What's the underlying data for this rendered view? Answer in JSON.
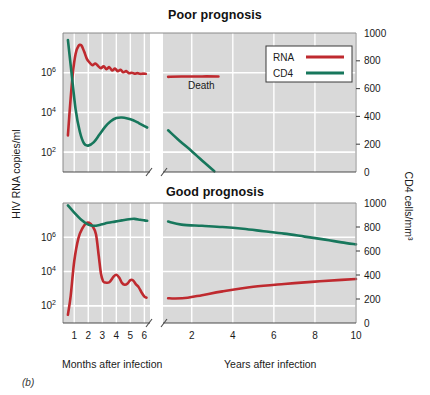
{
  "figure": {
    "panel_letter": "(b)",
    "colors": {
      "rna": "#bf2a2f",
      "cd4": "#17775c",
      "plot_background": "#d9d9d9",
      "gridline": "#ffffff",
      "axis": "#555555"
    }
  },
  "axes": {
    "y_left_title": "HIV RNA copies/ml",
    "y_right_title": "CD4 cells/mm³",
    "x_title_left": "Months after infection",
    "x_title_right": "Years after infection",
    "y_left_ticks": [
      {
        "label": "10",
        "exponent": "6",
        "value": 1000000
      },
      {
        "label": "10",
        "exponent": "4",
        "value": 10000
      },
      {
        "label": "10",
        "exponent": "2",
        "value": 100
      }
    ],
    "y_right_ticks": [
      "1000",
      "800",
      "600",
      "400",
      "200",
      "0"
    ],
    "x_ticks_months": [
      "1",
      "2",
      "3",
      "4",
      "5",
      "6"
    ],
    "x_ticks_years": [
      "2",
      "4",
      "6",
      "8",
      "10"
    ]
  },
  "legend": {
    "position": "top-right",
    "items": [
      {
        "label": "RNA",
        "color": "#bf2a2f"
      },
      {
        "label": "CD4",
        "color": "#17775c"
      }
    ]
  },
  "annotations": [
    {
      "text": "Death",
      "panel": "poor-prognosis"
    }
  ],
  "chart_data": [
    {
      "type": "line",
      "title": "Poor prognosis",
      "xlabel": "Months after infection / Years after infection",
      "ylabel": "HIV RNA copies/ml",
      "y2label": "CD4 cells/mm³",
      "ylim": [
        10,
        100000000
      ],
      "y2lim": [
        0,
        1000
      ],
      "yscale": "log",
      "grid": true,
      "legend_position": "top-right",
      "x_axis_break_after_months": 6,
      "annotation": "Death",
      "series": [
        {
          "name": "RNA",
          "color": "#bf2a2f",
          "axis": "left",
          "units": "copies/ml",
          "segment_months": {
            "x_months": [
              0.55,
              0.7,
              0.9,
              1.1,
              1.3,
              1.5,
              1.7,
              1.9,
              2.1,
              2.3,
              2.5,
              2.7,
              2.9,
              3.1,
              3.3,
              3.5,
              3.7,
              3.9,
              4.1,
              4.3,
              4.5,
              4.7,
              4.9,
              5.1,
              5.3,
              5.5,
              5.7,
              5.9,
              6.1
            ],
            "y_values": [
              700,
              20000,
              900000,
              9000000,
              22000000,
              24000000,
              12000000,
              5000000,
              3200000,
              2400000,
              2900000,
              2200000,
              1700000,
              2100000,
              1500000,
              1900000,
              1300000,
              1600000,
              1200000,
              1400000,
              1050000,
              1200000,
              950000,
              1000000,
              900000,
              950000,
              880000,
              900000,
              880000
            ]
          },
          "segment_years": {
            "x_years": [
              0.85,
              1.5,
              2.5,
              3.3
            ],
            "y_values": [
              620000,
              640000,
              650000,
              650000
            ]
          }
        },
        {
          "name": "CD4",
          "color": "#17775c",
          "axis": "right",
          "units": "cells/mm3",
          "segment_months": {
            "x_months": [
              0.55,
              0.8,
              1.1,
              1.4,
              1.7,
              2.0,
              2.4,
              2.8,
              3.2,
              3.6,
              4.0,
              4.4,
              4.8,
              5.2,
              5.6,
              6.0,
              6.2
            ],
            "y_values": [
              950,
              720,
              450,
              290,
              205,
              190,
              215,
              270,
              325,
              365,
              388,
              392,
              385,
              372,
              352,
              330,
              320
            ]
          },
          "segment_years": {
            "x_years": [
              0.85,
              1.4,
              2.0,
              2.6,
              3.1
            ],
            "y_values": [
              300,
              225,
              150,
              70,
              5
            ]
          }
        }
      ]
    },
    {
      "type": "line",
      "title": "Good prognosis",
      "xlabel": "Months after infection / Years after infection",
      "ylabel": "HIV RNA copies/ml",
      "y2label": "CD4 cells/mm³",
      "ylim": [
        10,
        100000000
      ],
      "y2lim": [
        0,
        1000
      ],
      "yscale": "log",
      "grid": true,
      "x_axis_break_after_months": 6,
      "series": [
        {
          "name": "RNA",
          "color": "#bf2a2f",
          "axis": "left",
          "units": "copies/ml",
          "segment_months": {
            "x_months": [
              0.55,
              0.75,
              1.0,
              1.3,
              1.6,
              1.85,
              2.05,
              2.3,
              2.55,
              2.75,
              2.9,
              3.05,
              3.2,
              3.5,
              3.8,
              4.0,
              4.2,
              4.4,
              4.6,
              4.8,
              5.0,
              5.2,
              5.4,
              5.6,
              5.8,
              6.0,
              6.15
            ],
            "y_values": [
              30,
              400,
              40000,
              900000,
              3500000,
              6500000,
              7000000,
              4500000,
              1500000,
              80000,
              8000,
              2800,
              2300,
              2400,
              5000,
              6500,
              4500,
              2200,
              1700,
              2000,
              3200,
              3000,
              1800,
              1200,
              600,
              350,
              300
            ]
          },
          "segment_years": {
            "x_years": [
              0.85,
              1.2,
              1.8,
              2.5,
              3.5,
              5.0,
              6.5,
              8.0,
              9.3,
              10.0
            ],
            "y_values": [
              280,
              270,
              300,
              420,
              700,
              1300,
              1900,
              2600,
              3300,
              3700
            ]
          }
        },
        {
          "name": "CD4",
          "color": "#17775c",
          "axis": "right",
          "units": "cells/mm3",
          "segment_months": {
            "x_months": [
              0.55,
              1.0,
              1.5,
              2.0,
              2.4,
              2.9,
              3.4,
              3.9,
              4.4,
              4.9,
              5.3,
              5.7,
              6.0,
              6.2
            ],
            "y_values": [
              980,
              920,
              860,
              820,
              810,
              820,
              835,
              845,
              855,
              865,
              868,
              860,
              855,
              852
            ]
          },
          "segment_years": {
            "x_years": [
              0.85,
              1.5,
              2.5,
              3.5,
              4.5,
              5.5,
              6.5,
              7.5,
              8.5,
              9.3,
              10.0
            ],
            "y_values": [
              845,
              820,
              810,
              800,
              785,
              765,
              745,
              720,
              695,
              672,
              655
            ]
          }
        }
      ]
    }
  ]
}
